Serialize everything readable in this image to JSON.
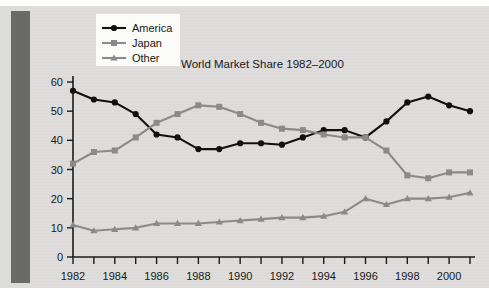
{
  "figure": {
    "title": "World Market Share 1982–2000",
    "background_color": "#dedddb",
    "spine_color": "#6a6a68"
  },
  "legend": {
    "position": "top-left",
    "entries": [
      {
        "label": "America",
        "color": "#101010",
        "marker": "circle"
      },
      {
        "label": "Japan",
        "color": "#8a8a8a",
        "marker": "square"
      },
      {
        "label": "Other",
        "color": "#8a8a8a",
        "marker": "triangle"
      }
    ]
  },
  "axes": {
    "y_ticklabels": [
      "60",
      "50",
      "40",
      "30",
      "20",
      "10",
      "0"
    ],
    "x_ticklabels": [
      "1982",
      "1984",
      "1986",
      "1988",
      "1990",
      "1992",
      "1994",
      "1996",
      "1998",
      "2000"
    ]
  },
  "chart_data": {
    "type": "line",
    "title": "World Market Share 1982–2000",
    "xlabel": "",
    "ylabel": "",
    "xlim": [
      1982,
      2001
    ],
    "ylim": [
      0,
      60
    ],
    "ytick_step": 10,
    "xtick_step": 1,
    "xticklabel_step": 2,
    "grid": false,
    "legend_position": "top-left",
    "x": [
      1982,
      1983,
      1984,
      1985,
      1986,
      1987,
      1988,
      1989,
      1990,
      1991,
      1992,
      1993,
      1994,
      1995,
      1996,
      1997,
      1998,
      1999,
      2000,
      2001
    ],
    "series": [
      {
        "name": "America",
        "color": "#101010",
        "marker": "circle",
        "values": [
          57,
          54,
          53,
          49,
          42,
          41,
          37,
          37,
          39,
          39,
          38.5,
          41,
          43.5,
          43.5,
          41,
          46.5,
          53,
          55,
          52,
          50
        ]
      },
      {
        "name": "Japan",
        "color": "#8a8a8a",
        "marker": "square",
        "values": [
          32,
          36,
          36.5,
          41,
          46,
          49,
          52,
          51.5,
          49,
          46,
          44,
          43.5,
          42,
          41,
          41,
          36.5,
          28,
          27,
          29,
          29
        ]
      },
      {
        "name": "Other",
        "color": "#8a8a8a",
        "marker": "triangle",
        "values": [
          11,
          9,
          9.5,
          10,
          11.5,
          11.5,
          11.5,
          12,
          12.5,
          13,
          13.5,
          13.5,
          14,
          15.5,
          20,
          18,
          20,
          20,
          20.5,
          22
        ]
      }
    ]
  }
}
